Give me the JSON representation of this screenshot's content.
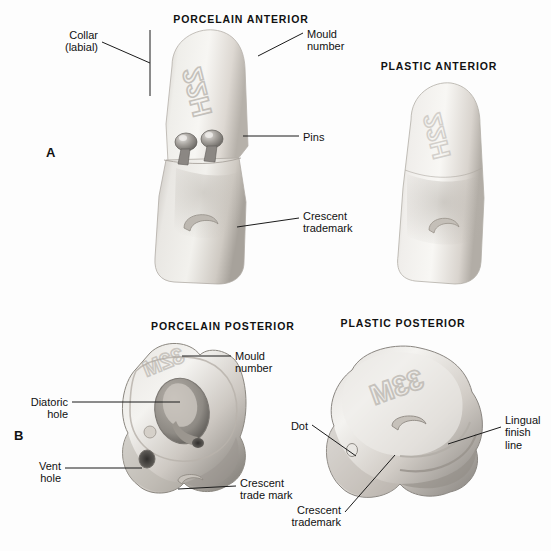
{
  "figure": {
    "panels": [
      {
        "letter": "A",
        "x": 46,
        "y": 145
      },
      {
        "letter": "B",
        "x": 14,
        "y": 428
      }
    ],
    "captions": [
      {
        "id": "porcelain-anterior",
        "text": "PORCELAIN  ANTERIOR",
        "x": 241,
        "y": 13
      },
      {
        "id": "plastic-anterior",
        "text": "PLASTIC  ANTERIOR",
        "x": 439,
        "y": 60
      },
      {
        "id": "porcelain-posterior",
        "text": "PORCELAIN  POSTERIOR",
        "x": 151,
        "y": 320
      },
      {
        "id": "plastic-posterior",
        "text": "PLASTIC  POSTERIOR",
        "x": 403,
        "y": 317
      }
    ],
    "labels": [
      {
        "id": "collar",
        "lines": [
          "Collar",
          "(labial)"
        ],
        "x": 98,
        "y": 29,
        "align": "right"
      },
      {
        "id": "mould-number-a",
        "lines": [
          "Mould",
          "number"
        ],
        "x": 307,
        "y": 28,
        "align": "left"
      },
      {
        "id": "pins",
        "lines": [
          "Pins"
        ],
        "x": 303,
        "y": 131,
        "align": "left"
      },
      {
        "id": "crescent-trademark-a",
        "lines": [
          "Crescent",
          "trademark"
        ],
        "x": 303,
        "y": 210,
        "align": "left"
      },
      {
        "id": "mould-number-b",
        "lines": [
          "Mould",
          "number"
        ],
        "x": 235,
        "y": 350,
        "align": "left"
      },
      {
        "id": "diatoric-hole",
        "lines": [
          "Diatoric",
          "hole"
        ],
        "x": 68,
        "y": 396,
        "align": "right"
      },
      {
        "id": "vent-hole",
        "lines": [
          "Vent",
          "hole"
        ],
        "x": 61,
        "y": 460,
        "align": "right"
      },
      {
        "id": "crescent-trademark-b",
        "lines": [
          "Crescent",
          "trade mark"
        ],
        "x": 240,
        "y": 477,
        "align": "left"
      },
      {
        "id": "dot",
        "lines": [
          "Dot"
        ],
        "x": 308,
        "y": 420,
        "align": "right"
      },
      {
        "id": "lingual-finish-line",
        "lines": [
          "Lingual",
          "finish",
          "line"
        ],
        "x": 505,
        "y": 414,
        "align": "left"
      },
      {
        "id": "crescent-trademark-c",
        "lines": [
          "Crescent",
          "trademark"
        ],
        "x": 341,
        "y": 512,
        "align": "right"
      }
    ],
    "mould_numbers": {
      "porcelain_anterior": "22H",
      "plastic_anterior": "22H",
      "porcelain_posterior": "32M",
      "plastic_posterior": "33M"
    },
    "colors": {
      "ink": "#1b1b1b",
      "tooth_light": "#f2f0ed",
      "tooth_mid": "#d8d4cf",
      "tooth_shadow": "#a9a49e",
      "pin_metal": "#8d8a86",
      "background": "#fdfdfd"
    }
  }
}
